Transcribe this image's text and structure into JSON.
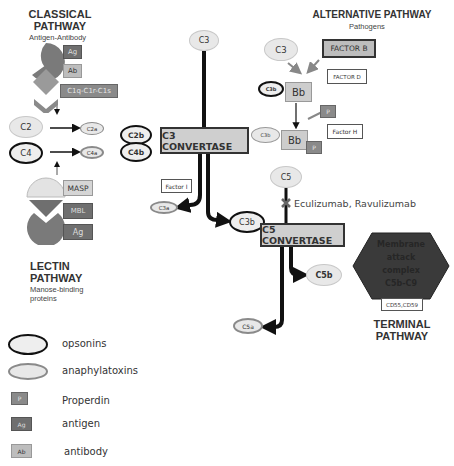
{
  "classical": {
    "title_line1": "CLASSICAL",
    "title_line2": "PATHWAY",
    "subtitle": "Antigen-Antibody",
    "labels": {
      "ag": "Ag",
      "ab": "Ab",
      "c1": "C1q-C1r-C1s"
    }
  },
  "lectin": {
    "title_line1": "LECTIN",
    "title_line2": "PATHWAY",
    "subtitle_line1": "Manose-binding",
    "subtitle_line2": "proteins",
    "labels": {
      "masp": "MASP",
      "mbl": "MBL",
      "ag": "Ag"
    }
  },
  "alternative": {
    "title": "ALTERNATIVE PATHWAY",
    "subtitle": "Pathogens",
    "c3": "C3",
    "factor_b": "FACTOR B",
    "factor_d": "FACTOR D",
    "c3b_top": "C3b",
    "bb_top": "Bb",
    "p_free": "P",
    "factor_h": "Factor H",
    "c3b_bottom": "C3b",
    "bb_bottom": "Bb",
    "p_bound": "P"
  },
  "cascade": {
    "c2": "C2",
    "c4": "C4",
    "c2a": "C2a",
    "c4a": "C4a",
    "c2b": "C2b",
    "c4b": "C4b",
    "c3_top": "C3",
    "c3_convertase": "C3 CONVERTASE",
    "factor_i": "Factor I",
    "c3a": "C3a",
    "c3b": "C3b",
    "c5": "C5",
    "drugs": "Eculizumab, Ravulizumab",
    "c5_convertase": "C5 CONVERTASE",
    "c5a": "C5a",
    "c5b": "C5b"
  },
  "terminal": {
    "mac_line1": "Membrane",
    "mac_line2": "attack",
    "mac_line3": "complex",
    "mac_line4": "C5b-C9",
    "regulators": "CD55,CD59",
    "title_line1": "TERMINAL",
    "title_line2": "PATHWAY"
  },
  "legend": {
    "items": [
      {
        "symbol": "opsonin-oval",
        "label": "opsonins"
      },
      {
        "symbol": "anaphylatoxin-oval",
        "label": "anaphylatoxins"
      },
      {
        "symbol": "P",
        "label": "Properdin"
      },
      {
        "symbol": "Ag",
        "label": "antigen"
      },
      {
        "symbol": "Ab",
        "label": "antibody"
      }
    ]
  },
  "colors": {
    "dark_gray": "#6f6f6f",
    "light_gray": "#bdbdbd",
    "mac_fill": "#3a3a3a",
    "convertase_fill": "#cfcfcf",
    "shape_gray": "#7a7a7a"
  }
}
